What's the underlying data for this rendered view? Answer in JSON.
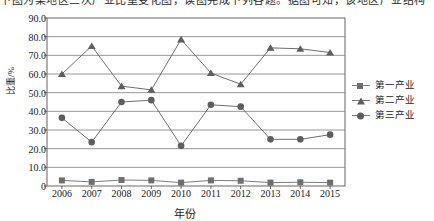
{
  "page": {
    "top_text_fragment": "下图为某地区三次产业比重变化图，读图完成下列各题。据图可知，该地区产业结构"
  },
  "axes": {
    "y_label": "比重/%",
    "x_label": "年份",
    "y_ticks": [
      "0",
      "10.0",
      "20.0",
      "30.0",
      "40.0",
      "50.0",
      "60.0",
      "70.0",
      "80.0",
      "90.0"
    ],
    "x_ticks": [
      "2006",
      "2007",
      "2008",
      "2009",
      "2010",
      "2011",
      "2012",
      "2013",
      "2014",
      "2015"
    ]
  },
  "legend": {
    "position": "right",
    "items": [
      {
        "label": "第一产业",
        "marker": "square-marker",
        "color": "#6e6e6e"
      },
      {
        "label": "第二产业",
        "marker": "triangle-marker",
        "color": "#5e5e5e"
      },
      {
        "label": "第三产业",
        "marker": "circle-marker",
        "color": "#5e5e5e"
      }
    ]
  },
  "chart_data": {
    "type": "line",
    "title": "",
    "xlabel": "年份",
    "ylabel": "比重/%",
    "ylim": [
      0,
      90
    ],
    "yticks": [
      0,
      10,
      20,
      30,
      40,
      50,
      60,
      70,
      80,
      90
    ],
    "grid": true,
    "legend_position": "right",
    "categories": [
      "2006",
      "2007",
      "2008",
      "2009",
      "2010",
      "2011",
      "2012",
      "2013",
      "2014",
      "2015"
    ],
    "series": [
      {
        "name": "第一产业",
        "marker": "square",
        "color": "#6e6e6e",
        "values": [
          3.0,
          2.2,
          3.2,
          3.0,
          1.8,
          3.0,
          2.8,
          1.8,
          2.0,
          1.8
        ]
      },
      {
        "name": "第二产业",
        "marker": "triangle",
        "color": "#5e5e5e",
        "values": [
          60.0,
          75.0,
          53.5,
          51.5,
          78.5,
          60.5,
          54.5,
          74.0,
          73.5,
          71.5
        ]
      },
      {
        "name": "第三产业",
        "marker": "circle",
        "color": "#5e5e5e",
        "values": [
          36.5,
          23.5,
          45.0,
          46.0,
          21.5,
          43.5,
          42.5,
          25.0,
          25.0,
          27.5
        ]
      }
    ]
  }
}
